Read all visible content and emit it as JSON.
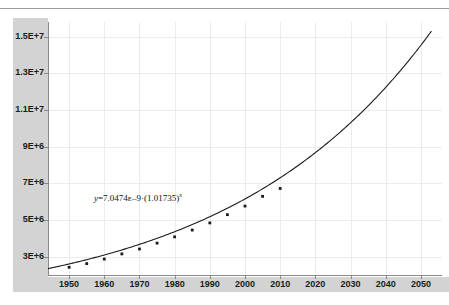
{
  "chart_data": {
    "type": "scatter",
    "title": "",
    "xlabel": "",
    "ylabel": "",
    "xlim": [
      1944,
      2056
    ],
    "ylim": [
      2000000,
      15800000
    ],
    "grid": true,
    "legend": null,
    "x_ticks": [
      "1950",
      "1960",
      "1970",
      "1980",
      "1990",
      "2000",
      "2010",
      "2020",
      "2030",
      "2040",
      "2050"
    ],
    "x_tick_values": [
      1950,
      1960,
      1970,
      1980,
      1990,
      2000,
      2010,
      2020,
      2030,
      2040,
      2050
    ],
    "y_ticks": [
      "1.5E+7",
      "1.3E+7",
      "1.1E+7",
      "9E+6",
      "7E+6",
      "5E+6",
      "3E+6"
    ],
    "y_tick_values": [
      15000000,
      13000000,
      11000000,
      9000000,
      7000000,
      5000000,
      3000000
    ],
    "annotation": {
      "text": "y=7.0474E-9 (1.01735)x",
      "lhs": "y",
      "eq": "=7.0474",
      "exp_mark": "E",
      "exp_val": "–9",
      "middot": "·",
      "base": "(1.01735)",
      "power": "x"
    },
    "series": [
      {
        "name": "observed",
        "type": "scatter",
        "marker": "square",
        "color": "#1a1a1a",
        "x": [
          1950,
          1955,
          1960,
          1965,
          1970,
          1975,
          1980,
          1985,
          1990,
          1995,
          2000,
          2005,
          2010
        ],
        "y": [
          2420000,
          2620000,
          2870000,
          3150000,
          3420000,
          3740000,
          4080000,
          4450000,
          4840000,
          5290000,
          5760000,
          6290000,
          6720000
        ]
      },
      {
        "name": "fit",
        "type": "line",
        "color": "#1a1a1a",
        "equation": "y = 7.0474E-9 * (1.01735)^x",
        "a": 7.0474e-09,
        "b": 1.01735,
        "x_start": 1944,
        "x_end": 2053
      }
    ]
  },
  "colors": {
    "band": "#d3d3d3",
    "grid": "#ececec",
    "axis": "#8a8a8a",
    "ink": "#1b1b1b",
    "curve": "#1a1a1a",
    "rule": "#9a9a9a"
  }
}
